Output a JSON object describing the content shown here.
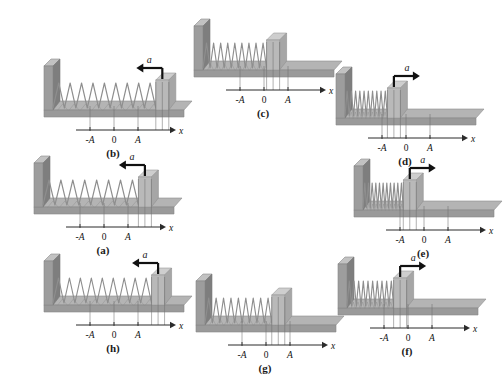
{
  "figure": {
    "type": "physics-diagram",
    "background_color": "#ffffff",
    "axis_tick_labels": [
      "-A",
      "0",
      "A"
    ],
    "axis_name": "x",
    "acceleration_symbol": "a",
    "colors": {
      "wall_front": "#9d9d9d",
      "wall_top": "#c2c2c2",
      "wall_side": "#7e7e7e",
      "base_top": "#b4b4b4",
      "base_front": "#9a9a9a",
      "block_front": "#b9b9b9",
      "block_top": "#cecece",
      "spring": "#8e8e8e",
      "arrow": "#111111",
      "axis": "#2b2b2b",
      "guide_line": "#6f6f6f"
    }
  },
  "panels": [
    {
      "id": "b",
      "label": "(b)",
      "x": 28,
      "y": 48,
      "block_position": "A",
      "block_x_frac": 0.97,
      "spring_state": "stretched",
      "coils": 9,
      "acceleration": "left",
      "acceleration_label": "a",
      "axis_label": "x",
      "ticks": [
        "-A",
        "0",
        "A"
      ]
    },
    {
      "id": "c",
      "label": "(c)",
      "x": 178,
      "y": 8,
      "block_position": "0",
      "block_x_frac": 0.6,
      "spring_state": "natural",
      "coils": 9,
      "acceleration": "none",
      "acceleration_label": "",
      "axis_label": "x",
      "ticks": [
        "-A",
        "0",
        "A"
      ]
    },
    {
      "id": "d",
      "label": "(d)",
      "x": 320,
      "y": 56,
      "block_position": "-A",
      "block_x_frac": 0.4,
      "spring_state": "compressed",
      "coils": 10,
      "acceleration": "right",
      "acceleration_label": "a",
      "axis_label": "x",
      "ticks": [
        "-A",
        "0",
        "A"
      ]
    },
    {
      "id": "a",
      "label": "(a)",
      "x": 18,
      "y": 145,
      "block_position": "A",
      "block_x_frac": 0.9,
      "spring_state": "stretched",
      "coils": 8,
      "acceleration": "left",
      "acceleration_label": "a",
      "axis_label": "x",
      "ticks": [
        "-A",
        "0",
        "A"
      ]
    },
    {
      "id": "e",
      "label": "(e)",
      "x": 338,
      "y": 148,
      "block_position": "-A",
      "block_x_frac": 0.38,
      "spring_state": "fully-compressed",
      "coils": 11,
      "acceleration": "right",
      "acceleration_label": "a",
      "axis_label": "x",
      "ticks": [
        "-A",
        "0",
        "A"
      ]
    },
    {
      "id": "h",
      "label": "(h)",
      "x": 28,
      "y": 243,
      "block_position": "A",
      "block_x_frac": 0.93,
      "spring_state": "stretched",
      "coils": 9,
      "acceleration": "left",
      "acceleration_label": "a",
      "axis_label": "x",
      "ticks": [
        "-A",
        "0",
        "A"
      ]
    },
    {
      "id": "g",
      "label": "(g)",
      "x": 180,
      "y": 263,
      "block_position": "0",
      "block_x_frac": 0.63,
      "spring_state": "natural",
      "coils": 9,
      "acceleration": "none",
      "acceleration_label": "",
      "axis_label": "x",
      "ticks": [
        "-A",
        "0",
        "A"
      ]
    },
    {
      "id": "f",
      "label": "(f)",
      "x": 322,
      "y": 246,
      "block_position": "-A",
      "block_x_frac": 0.44,
      "spring_state": "compressed",
      "coils": 10,
      "acceleration": "right",
      "acceleration_label": "a",
      "axis_label": "x",
      "ticks": [
        "-A",
        "0",
        "A"
      ]
    }
  ]
}
